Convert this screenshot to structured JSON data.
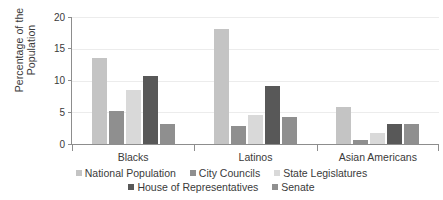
{
  "chart_data": {
    "type": "bar",
    "title": "",
    "xlabel": "",
    "ylabel": "Percentage of the\nPopulation",
    "ylim": [
      0,
      20
    ],
    "yticks": [
      0,
      5,
      10,
      15,
      20
    ],
    "ytick_labels": [
      "0",
      "5",
      "10",
      "15",
      "20"
    ],
    "grid": true,
    "legend_position": "bottom",
    "categories": [
      "Blacks",
      "Latinos",
      "Asian Americans"
    ],
    "series": [
      {
        "name": "National Population",
        "color": "#c4c4c4",
        "values": [
          13.5,
          18.1,
          5.8
        ]
      },
      {
        "name": "City Councils",
        "color": "#8f8f8f",
        "values": [
          5.2,
          2.9,
          0.6
        ]
      },
      {
        "name": "State Legislatures",
        "color": "#d9d9d9",
        "values": [
          8.5,
          4.6,
          1.7
        ]
      },
      {
        "name": "House of Representatives",
        "color": "#585858",
        "values": [
          10.7,
          9.1,
          3.2
        ]
      },
      {
        "name": "Senate",
        "color": "#8f8f8f",
        "values": [
          3.2,
          4.2,
          3.2
        ]
      }
    ]
  },
  "legend_rows": [
    [
      "National Population",
      "City Councils",
      "State Legislatures"
    ],
    [
      "House of Representatives",
      "Senate"
    ]
  ]
}
